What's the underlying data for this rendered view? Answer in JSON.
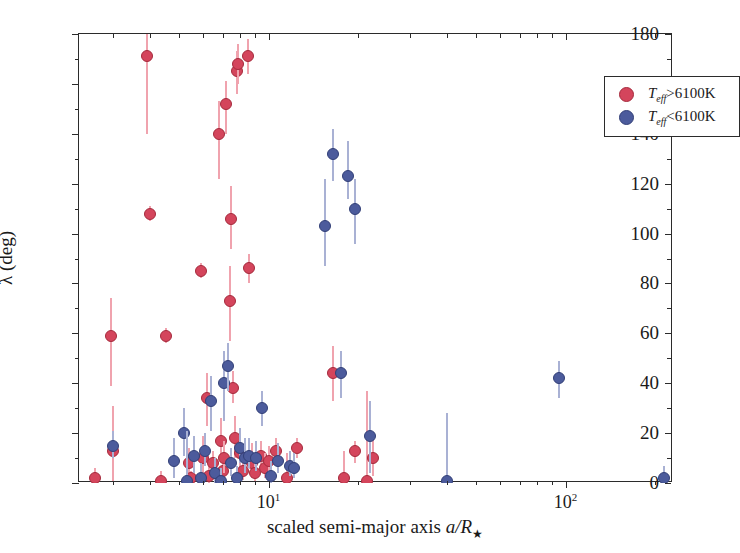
{
  "chart_data": {
    "type": "scatter",
    "title": "",
    "xlabel": "scaled semi-major axis a/R★",
    "ylabel": "λ (deg)",
    "xscale": "log",
    "yscale": "linear",
    "xlim": [
      2.3,
      230
    ],
    "ylim": [
      0,
      180
    ],
    "grid": false,
    "legend_position": "top-right",
    "xticks": [
      10,
      100
    ],
    "xtick_labels": [
      "10¹",
      "10²"
    ],
    "yticks": [
      0,
      20,
      40,
      60,
      80,
      100,
      120,
      140,
      160,
      180
    ],
    "ytick_labels": [
      "0",
      "20",
      "40",
      "60",
      "80",
      "100",
      "120",
      "140",
      "160",
      "180"
    ],
    "series": [
      {
        "name": "T_eff>6100K",
        "color": "#d4455c",
        "errorbar_color": "#f0a3ae",
        "points": [
          {
            "x": 2.6,
            "y": 2,
            "yerr_lo": 2,
            "yerr_hi": 4
          },
          {
            "x": 2.95,
            "y": 59,
            "yerr_lo": 20,
            "yerr_hi": 15
          },
          {
            "x": 3.0,
            "y": 13,
            "yerr_lo": 12,
            "yerr_hi": 18
          },
          {
            "x": 3.9,
            "y": 171,
            "yerr_lo": 31,
            "yerr_hi": 9
          },
          {
            "x": 4.0,
            "y": 108,
            "yerr_lo": 3,
            "yerr_hi": 3
          },
          {
            "x": 4.35,
            "y": 1,
            "yerr_lo": 1,
            "yerr_hi": 4
          },
          {
            "x": 4.5,
            "y": 59,
            "yerr_lo": 3,
            "yerr_hi": 3
          },
          {
            "x": 5.4,
            "y": 8,
            "yerr_lo": 5,
            "yerr_hi": 6
          },
          {
            "x": 5.5,
            "y": 2,
            "yerr_lo": 2,
            "yerr_hi": 3
          },
          {
            "x": 5.9,
            "y": 85,
            "yerr_lo": 3,
            "yerr_hi": 3
          },
          {
            "x": 6.0,
            "y": 10,
            "yerr_lo": 7,
            "yerr_hi": 9
          },
          {
            "x": 6.2,
            "y": 34,
            "yerr_lo": 11,
            "yerr_hi": 10
          },
          {
            "x": 6.3,
            "y": 3,
            "yerr_lo": 3,
            "yerr_hi": 5
          },
          {
            "x": 6.5,
            "y": 8,
            "yerr_lo": 4,
            "yerr_hi": 5
          },
          {
            "x": 6.8,
            "y": 140,
            "yerr_lo": 18,
            "yerr_hi": 13
          },
          {
            "x": 6.9,
            "y": 17,
            "yerr_lo": 8,
            "yerr_hi": 9
          },
          {
            "x": 7.0,
            "y": 5,
            "yerr_lo": 4,
            "yerr_hi": 6
          },
          {
            "x": 7.1,
            "y": 10,
            "yerr_lo": 6,
            "yerr_hi": 7
          },
          {
            "x": 7.2,
            "y": 152,
            "yerr_lo": 12,
            "yerr_hi": 9
          },
          {
            "x": 7.4,
            "y": 73,
            "yerr_lo": 16,
            "yerr_hi": 14
          },
          {
            "x": 7.5,
            "y": 106,
            "yerr_lo": 12,
            "yerr_hi": 13
          },
          {
            "x": 7.6,
            "y": 38,
            "yerr_lo": 6,
            "yerr_hi": 7
          },
          {
            "x": 7.7,
            "y": 18,
            "yerr_lo": 8,
            "yerr_hi": 9
          },
          {
            "x": 7.8,
            "y": 165,
            "yerr_lo": 9,
            "yerr_hi": 8
          },
          {
            "x": 7.9,
            "y": 168,
            "yerr_lo": 8,
            "yerr_hi": 8
          },
          {
            "x": 8.0,
            "y": 12,
            "yerr_lo": 7,
            "yerr_hi": 8
          },
          {
            "x": 8.2,
            "y": 5,
            "yerr_lo": 4,
            "yerr_hi": 5
          },
          {
            "x": 8.5,
            "y": 171,
            "yerr_lo": 7,
            "yerr_hi": 7
          },
          {
            "x": 8.6,
            "y": 86,
            "yerr_lo": 6,
            "yerr_hi": 6
          },
          {
            "x": 8.8,
            "y": 8,
            "yerr_lo": 6,
            "yerr_hi": 8
          },
          {
            "x": 9.0,
            "y": 4,
            "yerr_lo": 3,
            "yerr_hi": 5
          },
          {
            "x": 9.4,
            "y": 11,
            "yerr_lo": 5,
            "yerr_hi": 6
          },
          {
            "x": 9.7,
            "y": 6,
            "yerr_lo": 4,
            "yerr_hi": 6
          },
          {
            "x": 10.0,
            "y": 9,
            "yerr_lo": 5,
            "yerr_hi": 6
          },
          {
            "x": 10.6,
            "y": 13,
            "yerr_lo": 4,
            "yerr_hi": 5
          },
          {
            "x": 11.5,
            "y": 2,
            "yerr_lo": 2,
            "yerr_hi": 10
          },
          {
            "x": 12.5,
            "y": 14,
            "yerr_lo": 4,
            "yerr_hi": 4
          },
          {
            "x": 18.0,
            "y": 2,
            "yerr_lo": 2,
            "yerr_hi": 11
          },
          {
            "x": 19.5,
            "y": 13,
            "yerr_lo": 5,
            "yerr_hi": 4
          },
          {
            "x": 21.5,
            "y": 1,
            "yerr_lo": 1,
            "yerr_hi": 36
          },
          {
            "x": 22.5,
            "y": 10,
            "yerr_lo": 7,
            "yerr_hi": 8
          },
          {
            "x": 16.5,
            "y": 44,
            "yerr_lo": 11,
            "yerr_hi": 11
          }
        ]
      },
      {
        "name": "T_eff<6100K",
        "color": "#4c5b9c",
        "errorbar_color": "#a9b1d4",
        "points": [
          {
            "x": 3.0,
            "y": 15,
            "yerr_lo": 5,
            "yerr_hi": 6
          },
          {
            "x": 4.8,
            "y": 9,
            "yerr_lo": 7,
            "yerr_hi": 9
          },
          {
            "x": 5.2,
            "y": 20,
            "yerr_lo": 9,
            "yerr_hi": 10
          },
          {
            "x": 5.3,
            "y": 1,
            "yerr_lo": 1,
            "yerr_hi": 20
          },
          {
            "x": 5.6,
            "y": 11,
            "yerr_lo": 7,
            "yerr_hi": 8
          },
          {
            "x": 5.9,
            "y": 2,
            "yerr_lo": 2,
            "yerr_hi": 6
          },
          {
            "x": 6.1,
            "y": 13,
            "yerr_lo": 6,
            "yerr_hi": 7
          },
          {
            "x": 6.4,
            "y": 33,
            "yerr_lo": 12,
            "yerr_hi": 10
          },
          {
            "x": 6.6,
            "y": 4,
            "yerr_lo": 4,
            "yerr_hi": 6
          },
          {
            "x": 6.9,
            "y": 1,
            "yerr_lo": 1,
            "yerr_hi": 5
          },
          {
            "x": 7.1,
            "y": 40,
            "yerr_lo": 15,
            "yerr_hi": 13
          },
          {
            "x": 7.3,
            "y": 47,
            "yerr_lo": 10,
            "yerr_hi": 9
          },
          {
            "x": 7.5,
            "y": 8,
            "yerr_lo": 5,
            "yerr_hi": 6
          },
          {
            "x": 7.8,
            "y": 2,
            "yerr_lo": 2,
            "yerr_hi": 5
          },
          {
            "x": 8.0,
            "y": 14,
            "yerr_lo": 6,
            "yerr_hi": 8
          },
          {
            "x": 8.3,
            "y": 10,
            "yerr_lo": 6,
            "yerr_hi": 8
          },
          {
            "x": 8.6,
            "y": 11,
            "yerr_lo": 5,
            "yerr_hi": 7
          },
          {
            "x": 9.1,
            "y": 10,
            "yerr_lo": 5,
            "yerr_hi": 7
          },
          {
            "x": 9.5,
            "y": 30,
            "yerr_lo": 7,
            "yerr_hi": 7
          },
          {
            "x": 10.2,
            "y": 3,
            "yerr_lo": 3,
            "yerr_hi": 6
          },
          {
            "x": 10.8,
            "y": 9,
            "yerr_lo": 5,
            "yerr_hi": 7
          },
          {
            "x": 11.8,
            "y": 7,
            "yerr_lo": 4,
            "yerr_hi": 6
          },
          {
            "x": 12.2,
            "y": 6,
            "yerr_lo": 4,
            "yerr_hi": 6
          },
          {
            "x": 15.5,
            "y": 103,
            "yerr_lo": 16,
            "yerr_hi": 19
          },
          {
            "x": 16.5,
            "y": 132,
            "yerr_lo": 11,
            "yerr_hi": 10
          },
          {
            "x": 18.5,
            "y": 123,
            "yerr_lo": 9,
            "yerr_hi": 14
          },
          {
            "x": 19.5,
            "y": 110,
            "yerr_lo": 14,
            "yerr_hi": 12
          },
          {
            "x": 17.5,
            "y": 44,
            "yerr_lo": 10,
            "yerr_hi": 9
          },
          {
            "x": 22.0,
            "y": 19,
            "yerr_lo": 15,
            "yerr_hi": 14
          },
          {
            "x": 40.0,
            "y": 1,
            "yerr_lo": 1,
            "yerr_hi": 27
          },
          {
            "x": 95.0,
            "y": 42,
            "yerr_lo": 8,
            "yerr_hi": 7
          },
          {
            "x": 215.0,
            "y": 2,
            "yerr_lo": 2,
            "yerr_hi": 5
          }
        ]
      }
    ]
  },
  "legend": {
    "items": [
      {
        "label_prefix": "T",
        "label_sub": "eff",
        "label_suffix": ">6100K",
        "color": "#d4455c",
        "marker": "red-circle-marker"
      },
      {
        "label_prefix": "T",
        "label_sub": "eff",
        "label_suffix": "<6100K",
        "color": "#4c5b9c",
        "marker": "blue-circle-marker"
      }
    ]
  },
  "axes": {
    "y_title": "λ (deg)",
    "x_title_prefix": "scaled semi-major axis ",
    "x_title_var": "a/R",
    "x_title_star": "★"
  }
}
